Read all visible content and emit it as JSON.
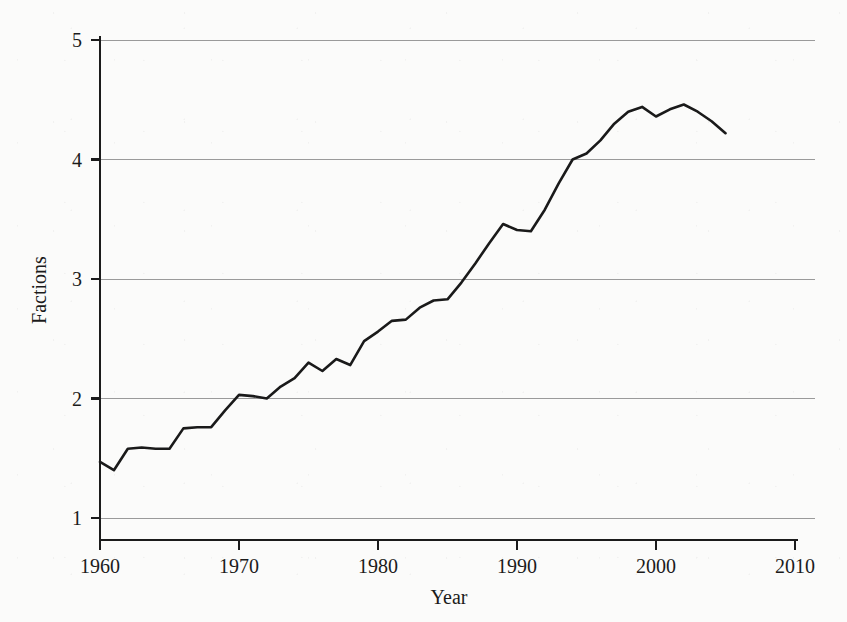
{
  "chart_data": {
    "type": "line",
    "title": "",
    "subtitle": "",
    "xlabel": "Year",
    "ylabel": "Factions",
    "xlim": [
      1958,
      2011.5
    ],
    "ylim": [
      0.82,
      5.18
    ],
    "xticks": [
      1960,
      1970,
      1980,
      1990,
      2000,
      2010
    ],
    "xtick_labels": [
      "1960",
      "1970",
      "1980",
      "1990",
      "2000",
      "2010"
    ],
    "yticks": [
      1,
      2,
      3,
      4,
      5
    ],
    "ytick_labels": [
      "1",
      "2",
      "3",
      "4",
      "5"
    ],
    "grid": "horizontal",
    "grid_color": "#9a9a9a",
    "legend": null,
    "line_color": "#1a1a1a",
    "background_color": "#fbfbfa",
    "series": [
      {
        "name": "Factions",
        "x": [
          1960,
          1961,
          1962,
          1963,
          1964,
          1965,
          1966,
          1967,
          1968,
          1969,
          1970,
          1971,
          1972,
          1973,
          1974,
          1975,
          1976,
          1977,
          1978,
          1979,
          1980,
          1981,
          1982,
          1983,
          1984,
          1985,
          1986,
          1987,
          1988,
          1989,
          1990,
          1991,
          1992,
          1993,
          1994,
          1995,
          1996,
          1997,
          1998,
          1999,
          2000,
          2001,
          2002,
          2003,
          2004,
          2005
        ],
        "values": [
          1.47,
          1.4,
          1.58,
          1.59,
          1.58,
          1.58,
          1.75,
          1.76,
          1.76,
          1.9,
          2.03,
          2.02,
          2.0,
          2.1,
          2.17,
          2.3,
          2.23,
          2.33,
          2.28,
          2.48,
          2.56,
          2.65,
          2.66,
          2.76,
          2.82,
          2.83,
          2.97,
          3.13,
          3.3,
          3.46,
          3.41,
          3.4,
          3.58,
          3.8,
          4.0,
          4.05,
          4.16,
          4.3,
          4.4,
          4.44,
          4.36,
          4.42,
          4.46,
          4.4,
          4.32,
          4.22
        ]
      }
    ]
  },
  "axes": {
    "ylabel_text": "Factions",
    "xlabel_text": "Year"
  }
}
